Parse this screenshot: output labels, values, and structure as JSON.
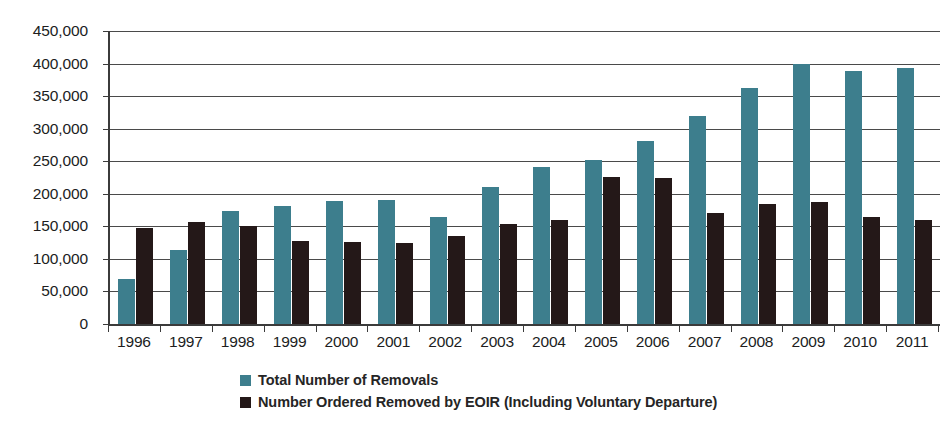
{
  "chart_data": {
    "type": "bar",
    "title": "",
    "subtitle": "",
    "xlabel": "",
    "ylabel": "",
    "ylim": [
      0,
      450000
    ],
    "ytick_values": [
      0,
      50000,
      100000,
      150000,
      200000,
      250000,
      300000,
      350000,
      400000,
      450000
    ],
    "ytick_labels": [
      "0",
      "50,000",
      "100,000",
      "150,000",
      "200,000",
      "250,000",
      "300,000",
      "350,000",
      "400,000",
      "450,000"
    ],
    "categories": [
      "1996",
      "1997",
      "1998",
      "1999",
      "2000",
      "2001",
      "2002",
      "2003",
      "2004",
      "2005",
      "2006",
      "2007",
      "2008",
      "2009",
      "2010",
      "2011"
    ],
    "grid": true,
    "legend_position": "bottom",
    "series": [
      {
        "name": "Total Number of Removals",
        "color": "#3d7e8d",
        "values": [
          69000,
          114000,
          173000,
          182000,
          189000,
          190000,
          164000,
          211000,
          241000,
          252000,
          281000,
          320000,
          362000,
          400000,
          388000,
          393000
        ]
      },
      {
        "name": "Number Ordered Removed by EOIR (Including Voluntary Departure)",
        "color": "#241818",
        "values": [
          147000,
          157000,
          150000,
          128000,
          126000,
          124000,
          135000,
          153000,
          160000,
          226000,
          224000,
          171000,
          184000,
          188000,
          164000,
          159000
        ]
      }
    ]
  },
  "axis": {
    "y_labels": [
      "450,000",
      "400,000",
      "350,000",
      "300,000",
      "250,000",
      "200,000",
      "150,000",
      "100,000",
      "50,000",
      "0"
    ],
    "x_labels": [
      "1996",
      "1997",
      "1998",
      "1999",
      "2000",
      "2001",
      "2002",
      "2003",
      "2004",
      "2005",
      "2006",
      "2007",
      "2008",
      "2009",
      "2010",
      "2011"
    ]
  },
  "legend": {
    "items": [
      {
        "label": "Total Number of Removals",
        "color": "#3d7e8d"
      },
      {
        "label": "Number Ordered Removed by EOIR (Including Voluntary Departure)",
        "color": "#241818"
      }
    ]
  },
  "colors": {
    "series_a": "#3d7e8d",
    "series_b": "#241818",
    "axis": "#3b3b3b",
    "grid": "#4a4a4a",
    "background": "#ffffff"
  }
}
